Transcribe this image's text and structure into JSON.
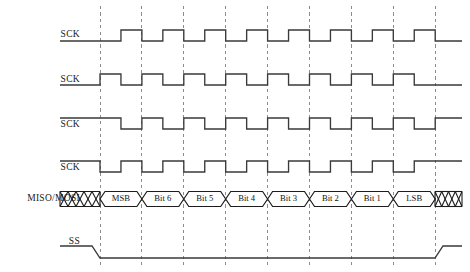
{
  "diagram": {
    "background_color": "#ffffff",
    "width": 470,
    "height": 272,
    "wave_color": "#3a3a3a",
    "grid_color": "#8c8c8c",
    "outline_color": "#1c1c1c",
    "text_color": "#1a1a1a"
  },
  "geometry": {
    "label_right_x": 80,
    "wave_start_x": 60,
    "wave_end_x": 462,
    "grid_first_x": 100,
    "grid_spacing": 41.9,
    "grid_count": 9,
    "grid_top_y": 6,
    "grid_bottom_y": 266,
    "high_offset": 11,
    "low_offset": 0
  },
  "rows": [
    {
      "name": "sck-mode-1",
      "label": "SCK",
      "label_y": 35,
      "baseline_y": 41,
      "type": "clock",
      "idle_level": "low",
      "phase_offset": 0.5,
      "pulse_count": 8
    },
    {
      "name": "sck-mode-0",
      "label": "SCK",
      "label_y": 80,
      "baseline_y": 85,
      "type": "clock",
      "idle_level": "low",
      "phase_offset": 0.0,
      "pulse_count": 8
    },
    {
      "name": "sck-mode-3",
      "label": "SCK",
      "label_y": 125,
      "baseline_y": 129,
      "type": "clock",
      "idle_level": "high",
      "phase_offset": 0.5,
      "pulse_count": 8
    },
    {
      "name": "sck-mode-2",
      "label": "SCK",
      "label_y": 168,
      "baseline_y": 172,
      "type": "clock",
      "idle_level": "high",
      "phase_offset": 0.0,
      "pulse_count": 8
    },
    {
      "name": "data-line",
      "label": "MISO/MOSI",
      "label_y": 199,
      "baseline_y": 199,
      "type": "data",
      "cell_half_height": 7.5,
      "crossover": 5
    },
    {
      "name": "slave-select",
      "label": "SS",
      "label_y": 242,
      "baseline_y": 258,
      "type": "enable",
      "idle_level": "high",
      "fall_x": 92,
      "rise_x": 435,
      "slope": 8,
      "high_offset": 12
    }
  ],
  "data_cells": [
    {
      "label": "MSB",
      "index": 0
    },
    {
      "label": "Bit 6",
      "index": 1
    },
    {
      "label": "Bit 5",
      "index": 2
    },
    {
      "label": "Bit 4",
      "index": 3
    },
    {
      "label": "Bit 3",
      "index": 4
    },
    {
      "label": "Bit 2",
      "index": 5
    },
    {
      "label": "Bit 1",
      "index": 6
    },
    {
      "label": "LSB",
      "index": 7
    }
  ],
  "hatch_regions": [
    {
      "name": "leading-undefined",
      "start_x": 60,
      "end_x": 100,
      "teeth": 5
    },
    {
      "name": "trailing-undefined",
      "start_x": 435,
      "end_x": 462,
      "teeth": 4
    }
  ]
}
